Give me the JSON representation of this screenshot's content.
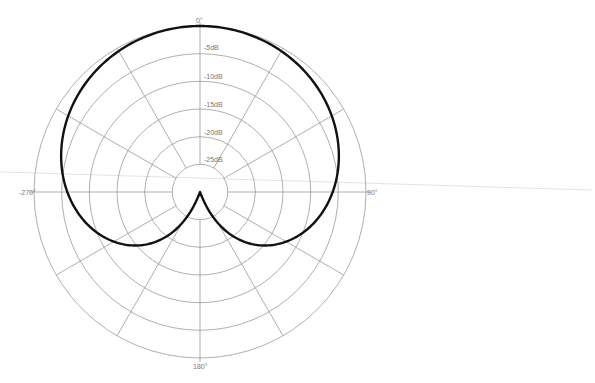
{
  "chart_data": {
    "type": "polar",
    "title": "",
    "angle_labels": [
      {
        "angle": 0,
        "label": "0°"
      },
      {
        "angle": 90,
        "label": "90°"
      },
      {
        "angle": 180,
        "label": "180°"
      },
      {
        "angle": 270,
        "label": "-270°"
      }
    ],
    "radial_unit": "dB",
    "radial_range": [
      -30,
      0
    ],
    "ring_labels": [
      "-5dB",
      "-10dB",
      "-15dB",
      "-20dB",
      "-25dB"
    ],
    "ring_values": [
      0,
      -5,
      -10,
      -15,
      -20,
      -25
    ],
    "spoke_step_deg": 30,
    "series": [
      {
        "name": "Cardioid",
        "formula": "gain = 0.5 + 0.5*cos(theta)",
        "angles_deg": [
          0,
          30,
          60,
          90,
          120,
          135,
          150,
          165,
          180,
          195,
          210,
          225,
          240,
          270,
          300,
          330
        ],
        "values_db": [
          0,
          -0.6,
          -2.5,
          -6.0,
          -12.0,
          -16.7,
          -23.4,
          -30,
          -30,
          -30,
          -23.4,
          -16.7,
          -12.0,
          -6.0,
          -2.5,
          -0.6
        ]
      }
    ]
  },
  "labels": {
    "top": "0°",
    "right": "90°",
    "bottom": "180°",
    "left": "-270°",
    "ring_5": "-5dB",
    "ring_10": "-10dB",
    "ring_15": "-15dB",
    "ring_20": "-20dB",
    "ring_25": "-25dB"
  }
}
